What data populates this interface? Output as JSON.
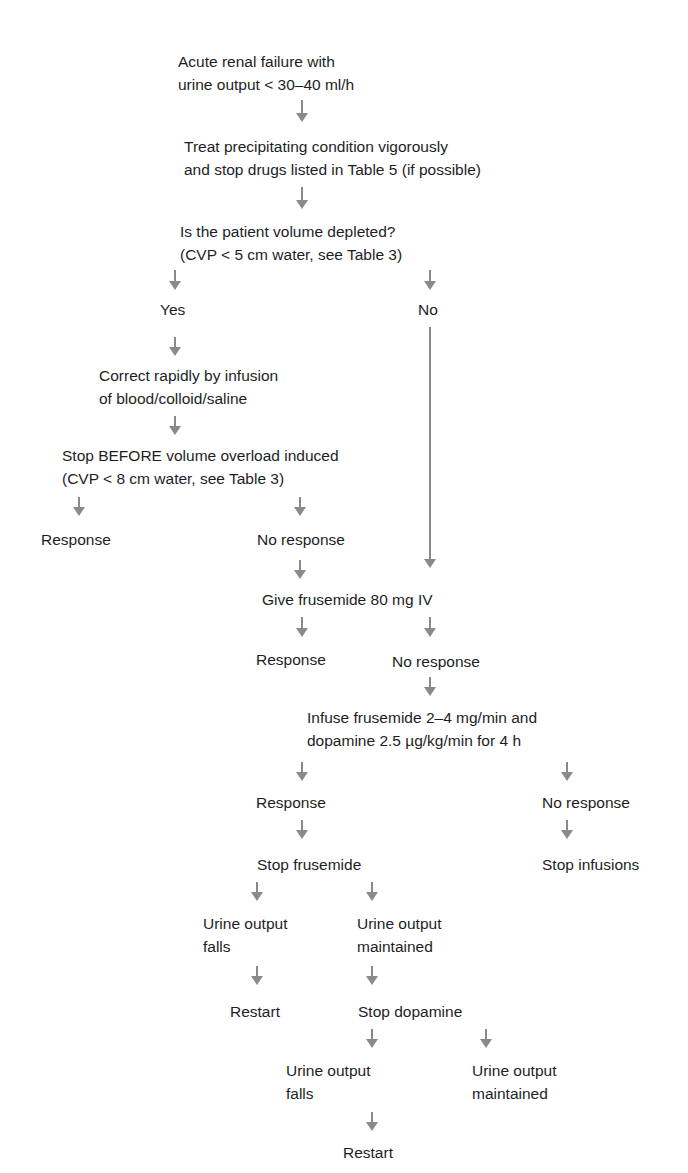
{
  "colors": {
    "text": "#1e1e1e",
    "arrow": "#8a8a8a",
    "background": "#ffffff"
  },
  "nodes": {
    "start": {
      "lines": [
        "Acute renal failure with",
        "urine output < 30–40 ml/h"
      ]
    },
    "treat": {
      "lines": [
        "Treat precipitating condition vigorously",
        "and stop drugs listed in Table 5 (if possible)"
      ]
    },
    "volume_question": {
      "lines": [
        "Is the patient volume depleted?",
        "(CVP < 5 cm water, see Table 3)"
      ]
    },
    "yes": {
      "lines": [
        "Yes"
      ]
    },
    "no": {
      "lines": [
        "No"
      ]
    },
    "correct": {
      "lines": [
        "Correct rapidly by infusion",
        "of blood/colloid/saline"
      ]
    },
    "stop_before": {
      "lines": [
        "Stop BEFORE volume overload induced",
        "(CVP < 8 cm water, see Table 3)"
      ]
    },
    "response_1": {
      "lines": [
        "Response"
      ]
    },
    "no_response_1": {
      "lines": [
        "No response"
      ]
    },
    "give_frusemide": {
      "lines": [
        "Give frusemide 80 mg IV"
      ]
    },
    "response_2": {
      "lines": [
        "Response"
      ]
    },
    "no_response_2": {
      "lines": [
        "No response"
      ]
    },
    "infuse": {
      "lines": [
        "Infuse frusemide 2–4 mg/min and",
        "dopamine 2.5 µg/kg/min for 4 h"
      ]
    },
    "response_3": {
      "lines": [
        "Response"
      ]
    },
    "no_response_3": {
      "lines": [
        "No response"
      ]
    },
    "stop_frusemide": {
      "lines": [
        "Stop frusemide"
      ]
    },
    "stop_infusions": {
      "lines": [
        "Stop infusions"
      ]
    },
    "urine_falls_1": {
      "lines": [
        "Urine output",
        "falls"
      ]
    },
    "urine_maintained_1": {
      "lines": [
        "Urine output",
        "maintained"
      ]
    },
    "restart_1": {
      "lines": [
        "Restart"
      ]
    },
    "stop_dopamine": {
      "lines": [
        "Stop dopamine"
      ]
    },
    "urine_falls_2": {
      "lines": [
        "Urine output",
        "falls"
      ]
    },
    "urine_maintained_2": {
      "lines": [
        "Urine output",
        "maintained"
      ]
    },
    "restart_2": {
      "lines": [
        "Restart"
      ]
    }
  },
  "edges": [
    [
      "start",
      "treat"
    ],
    [
      "treat",
      "volume_question"
    ],
    [
      "volume_question",
      "yes"
    ],
    [
      "volume_question",
      "no"
    ],
    [
      "yes",
      "correct"
    ],
    [
      "correct",
      "stop_before"
    ],
    [
      "stop_before",
      "response_1"
    ],
    [
      "stop_before",
      "no_response_1"
    ],
    [
      "no",
      "give_frusemide"
    ],
    [
      "no_response_1",
      "give_frusemide"
    ],
    [
      "give_frusemide",
      "response_2"
    ],
    [
      "give_frusemide",
      "no_response_2"
    ],
    [
      "no_response_2",
      "infuse"
    ],
    [
      "infuse",
      "response_3"
    ],
    [
      "infuse",
      "no_response_3"
    ],
    [
      "response_3",
      "stop_frusemide"
    ],
    [
      "no_response_3",
      "stop_infusions"
    ],
    [
      "stop_frusemide",
      "urine_falls_1"
    ],
    [
      "stop_frusemide",
      "urine_maintained_1"
    ],
    [
      "urine_falls_1",
      "restart_1"
    ],
    [
      "urine_maintained_1",
      "stop_dopamine"
    ],
    [
      "stop_dopamine",
      "urine_falls_2"
    ],
    [
      "stop_dopamine",
      "urine_maintained_2"
    ],
    [
      "urine_falls_2",
      "restart_2"
    ]
  ]
}
